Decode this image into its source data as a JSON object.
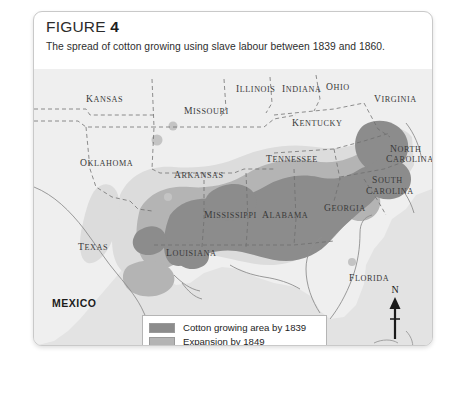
{
  "scan_remnant": "",
  "figure": {
    "label": "FIGURE",
    "number": "4",
    "caption": "The spread of cotton growing using slave labour between 1839 and 1860."
  },
  "map": {
    "country_labels": [
      {
        "name": "MEXICO",
        "x": 18,
        "y": 228
      }
    ],
    "state_labels": [
      {
        "name": "Kansas",
        "x": 52,
        "y": 24
      },
      {
        "name": "Missouri",
        "x": 150,
        "y": 36
      },
      {
        "name": "Illinois",
        "x": 202,
        "y": 14
      },
      {
        "name": "Indiana",
        "x": 248,
        "y": 14
      },
      {
        "name": "Ohio",
        "x": 292,
        "y": 12
      },
      {
        "name": "Virginia",
        "x": 340,
        "y": 24
      },
      {
        "name": "Kentucky",
        "x": 258,
        "y": 48
      },
      {
        "name": "Oklahoma",
        "x": 46,
        "y": 88
      },
      {
        "name": "Arkansas",
        "x": 140,
        "y": 100
      },
      {
        "name": "Tennessee",
        "x": 232,
        "y": 84
      },
      {
        "name": "North",
        "x": 356,
        "y": 74
      },
      {
        "name": "Carolina",
        "x": 352,
        "y": 84
      },
      {
        "name": "South",
        "x": 338,
        "y": 105
      },
      {
        "name": "Carolina",
        "x": 332,
        "y": 116
      },
      {
        "name": "Mississippi",
        "x": 170,
        "y": 140
      },
      {
        "name": "Alabama",
        "x": 228,
        "y": 140
      },
      {
        "name": "Georgia",
        "x": 290,
        "y": 133
      },
      {
        "name": "Texas",
        "x": 44,
        "y": 172
      },
      {
        "name": "Louisiana",
        "x": 132,
        "y": 178
      },
      {
        "name": "Florida",
        "x": 315,
        "y": 203
      }
    ]
  },
  "legend": {
    "items": [
      {
        "label": "Cotton growing area by 1839",
        "color": "#8c8c8c"
      },
      {
        "label": "Expansion by 1849",
        "color": "#b4b4b4"
      },
      {
        "label": "Expansion by 1860",
        "color": "#e8e8e8"
      }
    ]
  },
  "compass": {
    "north_label": "N",
    "icon": "north-arrow-icon"
  },
  "scale": {
    "min": "0",
    "max": "300m"
  },
  "colors": {
    "map_background": "#e3e3e3",
    "land_light": "#ececec",
    "zone_1839": "#8c8c8c",
    "zone_1849": "#b4b4b4",
    "zone_1860": "#dcdcdc",
    "card_border": "#c9c9c9"
  }
}
